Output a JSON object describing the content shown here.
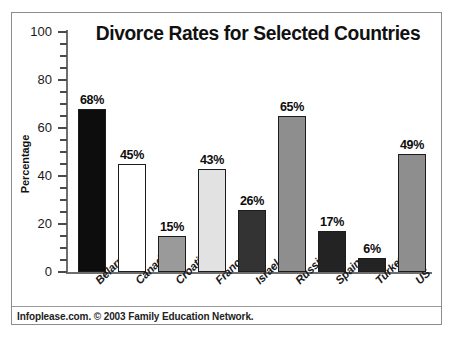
{
  "figure": {
    "frame_border_color": "#8d8d8d",
    "background": "#ffffff"
  },
  "footer": {
    "credit": "Infoplease.com. © 2003 Family Education Network."
  },
  "chart_data": {
    "type": "bar",
    "title": "Divorce Rates for Selected Countries",
    "xlabel": "",
    "ylabel": "Percentage",
    "ylim": [
      0,
      100
    ],
    "ytick_labels": [
      "100",
      "80",
      "60",
      "40",
      "20",
      "0"
    ],
    "ytick_values": [
      100,
      80,
      60,
      40,
      20,
      0
    ],
    "minor_tick_step": 5,
    "grid": false,
    "legend": "none",
    "value_label_suffix": "%",
    "categories": [
      "Belarus",
      "Canada",
      "Croatia",
      "France",
      "Israel",
      "Russia",
      "Spain",
      "Turkey",
      "US"
    ],
    "values": [
      68,
      45,
      15,
      43,
      26,
      65,
      17,
      6,
      49
    ],
    "value_labels": [
      "68%",
      "45%",
      "15%",
      "43%",
      "26%",
      "65%",
      "17%",
      "6%",
      "49%"
    ],
    "bar_colors": [
      "#0d0d0d",
      "#ffffff",
      "#9a9a9a",
      "#e2e2e2",
      "#333333",
      "#8e8e8e",
      "#232323",
      "#232323",
      "#8e8e8e"
    ],
    "bar_edge_color": "#1c1c1c"
  }
}
